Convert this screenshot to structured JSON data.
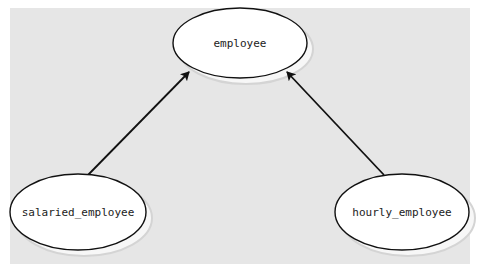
{
  "diagram": {
    "type": "class-inheritance",
    "background": "#e6e6e6",
    "nodes": [
      {
        "id": "employee",
        "label": "employee",
        "cx": 240,
        "cy": 43,
        "rx": 67,
        "ry": 35
      },
      {
        "id": "salaried_employee",
        "label": "salaried_employee",
        "cx": 78,
        "cy": 212,
        "rx": 68,
        "ry": 38
      },
      {
        "id": "hourly_employee",
        "label": "hourly_employee",
        "cx": 402,
        "cy": 212,
        "rx": 67,
        "ry": 38
      }
    ],
    "edges": [
      {
        "from": "salaried_employee",
        "to": "employee",
        "style": "arrow"
      },
      {
        "from": "hourly_employee",
        "to": "employee",
        "style": "arrow"
      }
    ]
  }
}
